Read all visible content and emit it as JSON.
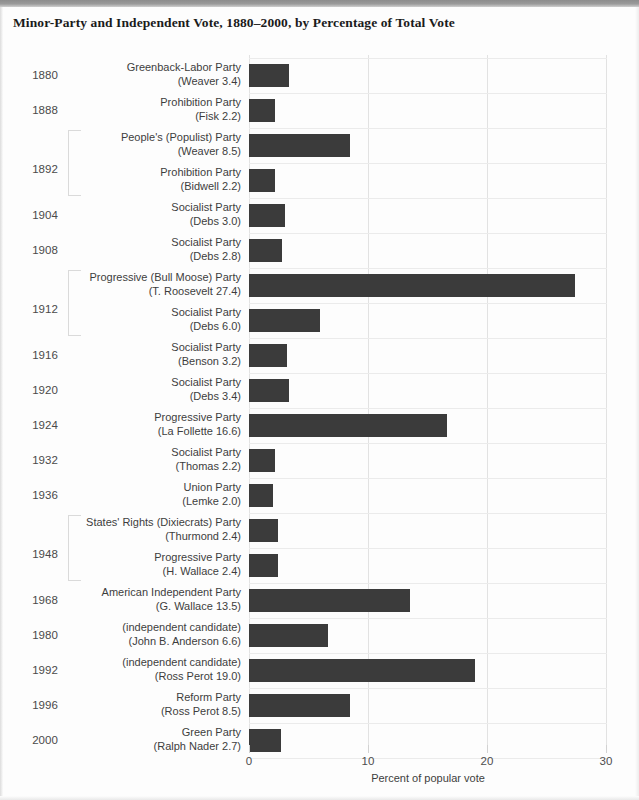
{
  "document": {
    "title": "Minor-Party and Independent Vote, 1880–2000, by Percentage of Total Vote"
  },
  "axis": {
    "title": "Percent of popular vote",
    "ticks": [
      "0",
      "10",
      "20",
      "30"
    ]
  },
  "chart_data": {
    "type": "bar",
    "orientation": "horizontal",
    "title": "Minor-Party and Independent Vote, 1880–2000, by Percentage of Total Vote",
    "xlabel": "Percent of popular vote",
    "ylabel": "",
    "xlim": [
      0,
      30
    ],
    "xticks": [
      0,
      10,
      20,
      30
    ],
    "grid": "vertical",
    "legend": "none",
    "bar_color": "#3b3b3b",
    "categories": [
      "1880 Greenback-Labor Party (Weaver)",
      "1888 Prohibition Party (Fisk)",
      "1892 People's (Populist) Party (Weaver)",
      "1892 Prohibition Party (Bidwell)",
      "1904 Socialist Party (Debs)",
      "1908 Socialist Party (Debs)",
      "1912 Progressive (Bull Moose) Party (T. Roosevelt)",
      "1912 Socialist Party (Debs)",
      "1916 Socialist Party (Benson)",
      "1920 Socialist Party (Debs)",
      "1924 Progressive Party (La Follette)",
      "1932 Socialist Party (Thomas)",
      "1936 Union Party (Lemke)",
      "1948 States' Rights (Dixiecrats) Party (Thurmond)",
      "1948 Progressive Party (H. Wallace)",
      "1968 American Independent Party (G. Wallace)",
      "1980 (independent candidate) (John B. Anderson)",
      "1992 (independent candidate) (Ross Perot)",
      "1996 Reform Party (Ross Perot)",
      "2000 Green Party (Ralph Nader)"
    ],
    "values": [
      3.4,
      2.2,
      8.5,
      2.2,
      3.0,
      2.8,
      27.4,
      6.0,
      3.2,
      3.4,
      16.6,
      2.2,
      2.0,
      2.4,
      2.4,
      13.5,
      6.6,
      19.0,
      8.5,
      2.7
    ]
  },
  "rows": [
    {
      "year": "1880",
      "party": "Greenback-Labor Party",
      "candidate": "(Weaver 3.4)",
      "value": 3.4,
      "group": null
    },
    {
      "year": "1888",
      "party": "Prohibition Party",
      "candidate": "(Fisk 2.2)",
      "value": 2.2,
      "group": null
    },
    {
      "year": "1892",
      "party": "People's (Populist) Party",
      "candidate": "(Weaver 8.5)",
      "value": 8.5,
      "group": "start"
    },
    {
      "year": "",
      "party": "Prohibition Party",
      "candidate": "(Bidwell 2.2)",
      "value": 2.2,
      "group": "end"
    },
    {
      "year": "1904",
      "party": "Socialist Party",
      "candidate": "(Debs 3.0)",
      "value": 3.0,
      "group": null
    },
    {
      "year": "1908",
      "party": "Socialist Party",
      "candidate": "(Debs 2.8)",
      "value": 2.8,
      "group": null
    },
    {
      "year": "1912",
      "party": "Progressive (Bull Moose) Party",
      "candidate": "(T. Roosevelt 27.4)",
      "value": 27.4,
      "group": "start"
    },
    {
      "year": "",
      "party": "Socialist Party",
      "candidate": "(Debs 6.0)",
      "value": 6.0,
      "group": "end"
    },
    {
      "year": "1916",
      "party": "Socialist Party",
      "candidate": "(Benson 3.2)",
      "value": 3.2,
      "group": null
    },
    {
      "year": "1920",
      "party": "Socialist Party",
      "candidate": "(Debs 3.4)",
      "value": 3.4,
      "group": null
    },
    {
      "year": "1924",
      "party": "Progressive Party",
      "candidate": "(La Follette 16.6)",
      "value": 16.6,
      "group": null
    },
    {
      "year": "1932",
      "party": "Socialist Party",
      "candidate": "(Thomas 2.2)",
      "value": 2.2,
      "group": null
    },
    {
      "year": "1936",
      "party": "Union Party",
      "candidate": "(Lemke 2.0)",
      "value": 2.0,
      "group": null
    },
    {
      "year": "1948",
      "party": "States' Rights (Dixiecrats) Party",
      "candidate": "(Thurmond 2.4)",
      "value": 2.4,
      "group": "start"
    },
    {
      "year": "",
      "party": "Progressive Party",
      "candidate": "(H. Wallace 2.4)",
      "value": 2.4,
      "group": "end"
    },
    {
      "year": "1968",
      "party": "American Independent Party",
      "candidate": "(G. Wallace 13.5)",
      "value": 13.5,
      "group": null
    },
    {
      "year": "1980",
      "party": "(independent candidate)",
      "candidate": "(John B. Anderson 6.6)",
      "value": 6.6,
      "group": null
    },
    {
      "year": "1992",
      "party": "(independent candidate)",
      "candidate": "(Ross Perot 19.0)",
      "value": 19.0,
      "group": null
    },
    {
      "year": "1996",
      "party": "Reform Party",
      "candidate": "(Ross Perot 8.5)",
      "value": 8.5,
      "group": null
    },
    {
      "year": "2000",
      "party": "Green Party",
      "candidate": "(Ralph Nader 2.7)",
      "value": 2.7,
      "group": null
    }
  ]
}
